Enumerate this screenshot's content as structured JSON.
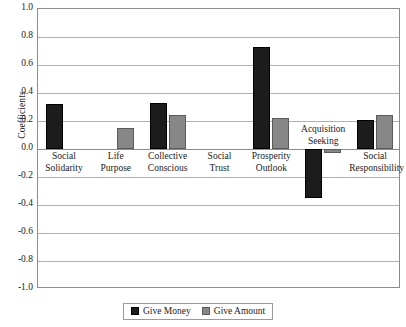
{
  "chart_data": {
    "type": "bar",
    "title": "",
    "xlabel": "",
    "ylabel": "Coefficients",
    "ylim": [
      -1.0,
      1.0
    ],
    "ytick_labels": [
      "1.0",
      "0.8",
      "0.6",
      "0.4",
      "0.2",
      "0.0",
      "-0.2",
      "-0.4",
      "-0.6",
      "-0.8",
      "-1.0"
    ],
    "ytick_values": [
      1.0,
      0.8,
      0.6,
      0.4,
      0.2,
      0.0,
      -0.2,
      -0.4,
      -0.6,
      -0.8,
      -1.0
    ],
    "grid": true,
    "legend_position": "bottom",
    "categories": [
      "Social Solidarity",
      "Life Purpose",
      "Collective Conscious",
      "Social Trust",
      "Prosperity Outlook",
      "Acquisition Seeking",
      "Social Responsibility"
    ],
    "category_lines": [
      [
        "Social",
        "Solidarity"
      ],
      [
        "Life",
        "Purpose"
      ],
      [
        "Collective",
        "Conscious"
      ],
      [
        "Social",
        "Trust"
      ],
      [
        "Prosperity",
        "Outlook"
      ],
      [
        "Acquisition",
        "Seeking"
      ],
      [
        "Social",
        "Responsibility"
      ]
    ],
    "series": [
      {
        "name": "Give Money",
        "color": "#1c1c1c",
        "values": [
          0.32,
          0.0,
          0.33,
          0.0,
          0.73,
          -0.35,
          0.21
        ]
      },
      {
        "name": "Give Amount",
        "color": "#878787",
        "values": [
          0.0,
          0.15,
          0.24,
          0.0,
          0.22,
          -0.03,
          0.24
        ]
      }
    ]
  },
  "legend": {
    "items": [
      {
        "label": "Give Money",
        "swatch": "money"
      },
      {
        "label": "Give Amount",
        "swatch": "amount"
      }
    ]
  }
}
